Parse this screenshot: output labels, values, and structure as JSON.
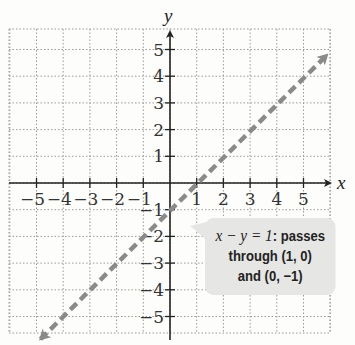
{
  "chart_data": {
    "type": "line",
    "title": "",
    "xlabel": "x",
    "ylabel": "y",
    "xlim": [
      -5.7,
      6
    ],
    "ylim": [
      -5.6,
      5.8
    ],
    "grid": true,
    "x_ticks": [
      -5,
      -4,
      -3,
      -2,
      -1,
      1,
      2,
      3,
      4,
      5
    ],
    "y_ticks": [
      -5,
      -4,
      -3,
      -2,
      -1,
      1,
      2,
      3,
      4,
      5
    ],
    "x_tick_labels": [
      "−5",
      "−4",
      "−3",
      "−2",
      "−1",
      "1",
      "2",
      "3",
      "4",
      "5"
    ],
    "y_tick_labels": [
      "−5",
      "−4",
      "−3",
      "−2",
      "−1",
      "1",
      "2",
      "3",
      "4",
      "5"
    ],
    "series": [
      {
        "name": "x − y = 1",
        "style": "dashed",
        "color": "#8a8a8a",
        "arrows": "both",
        "x": [
          -5,
          6
        ],
        "y": [
          -6,
          5
        ]
      }
    ],
    "annotations": [
      {
        "text_equation": "x − y = 1",
        "text_rest": ": passes through (1, 0) and (0, −1)",
        "points": [
          [
            1,
            0
          ],
          [
            0,
            -1
          ]
        ]
      }
    ]
  },
  "callout": {
    "equation": "x − y = 1",
    "line1_rest": ": passes",
    "line2": "through (1, 0)",
    "line3": "and (0, −1)"
  }
}
